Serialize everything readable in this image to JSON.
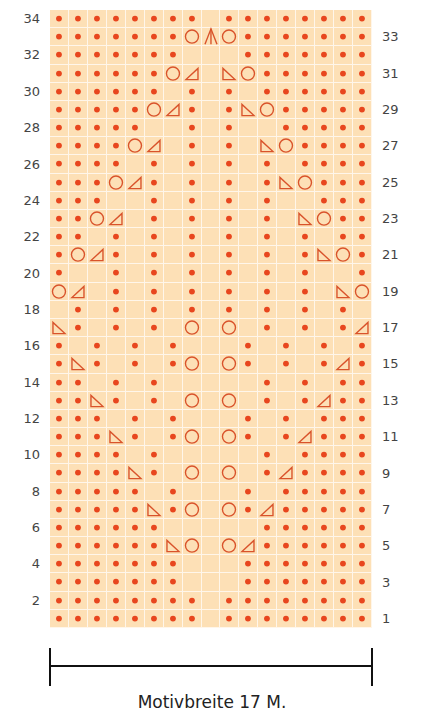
{
  "chart": {
    "columns": 17,
    "rows": 34,
    "colors": {
      "background": "#fde0b6",
      "gridline": "#fff6ea",
      "symbol": "#e8461e",
      "outline": "#d9532b"
    },
    "legend_symbols": {
      "k": "dot (knit)",
      "e": "empty cell",
      "o": "circle (yarn over)",
      "R": "triangle vertical right",
      "L": "triangle vertical left",
      "A": "double decrease"
    },
    "grid_top_to_bottom": [
      {
        "row": 34,
        "cells": "kkkkkkkkekkkkkkkk"
      },
      {
        "row": 33,
        "cells": "kkkkkkkoAokkkkkkk"
      },
      {
        "row": 32,
        "cells": "kkkkkkkeeekkkkkkk"
      },
      {
        "row": 31,
        "cells": "kkkkkkoReLokkkkkk"
      },
      {
        "row": 30,
        "cells": "kkkkkkekekekkkkkk"
      },
      {
        "row": 29,
        "cells": "kkkkkoRkekLokkkkk"
      },
      {
        "row": 28,
        "cells": "kkkkkeekekeekkkkk"
      },
      {
        "row": 27,
        "cells": "kkkkoRekekeLokkkk"
      },
      {
        "row": 26,
        "cells": "kkkkekekekekekkkk"
      },
      {
        "row": 25,
        "cells": "kkkoRkekekekLokkk"
      },
      {
        "row": 24,
        "cells": "kkkeekekekekeekkk"
      },
      {
        "row": 23,
        "cells": "kkoRekekekekeLokk"
      },
      {
        "row": 22,
        "cells": "kkekekekekekekekk"
      },
      {
        "row": 21,
        "cells": "koRkekekekekekLok"
      },
      {
        "row": 20,
        "cells": "keekekekekekekeek"
      },
      {
        "row": 19,
        "cells": "oRekekekekekekeLo"
      },
      {
        "row": 18,
        "cells": "ekekekekekekekeke"
      },
      {
        "row": 17,
        "cells": "Lkekekeoeoekekekr"
      },
      {
        "row": 16,
        "cells": "kekekekeeekekekek"
      },
      {
        "row": 15,
        "cells": "kLkekekoeokekekrk"
      },
      {
        "row": 14,
        "cells": "kkekekeeeeekekekk"
      },
      {
        "row": 13,
        "cells": "kkLkekeoeoekekrkk"
      },
      {
        "row": 12,
        "cells": "kkkekekeeekekekkk"
      },
      {
        "row": 11,
        "cells": "kkkLkekoeokekrkkk"
      },
      {
        "row": 10,
        "cells": "kkkkekeeeeekekkkk"
      },
      {
        "row": 9,
        "cells": "kkkkLkeoeoekrkkkk"
      },
      {
        "row": 8,
        "cells": "kkkkkekeeekekkkkk"
      },
      {
        "row": 7,
        "cells": "kkkkkLkoeokrkkkkk"
      },
      {
        "row": 6,
        "cells": "kkkkkkeeeeekkkkkk"
      },
      {
        "row": 5,
        "cells": "kkkkkkLoeorkkkkkk"
      },
      {
        "row": 4,
        "cells": "kkkkkkkeeekkkkkkk"
      },
      {
        "row": 3,
        "cells": "kkkkkkkeeekkkkkkk"
      },
      {
        "row": 2,
        "cells": "kkkkkkkkekkkkkkkk"
      },
      {
        "row": 1,
        "cells": "kkkkkkkkekkkkkkkk"
      }
    ],
    "left_labels": [
      "34",
      "32",
      "30",
      "28",
      "26",
      "24",
      "22",
      "20",
      "18",
      "16",
      "14",
      "12",
      "10",
      "8",
      "6",
      "4",
      "2"
    ],
    "right_labels": [
      "33",
      "31",
      "29",
      "27",
      "25",
      "23",
      "21",
      "19",
      "17",
      "15",
      "13",
      "11",
      "9",
      "7",
      "5",
      "3",
      "1"
    ]
  },
  "footer": {
    "caption": "Motivbreite 17 M."
  }
}
